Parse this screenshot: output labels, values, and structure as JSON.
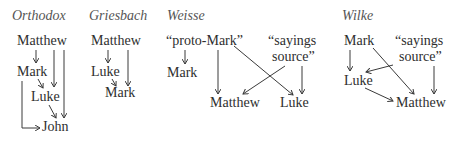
{
  "diagrams": [
    {
      "title": "Orthodox",
      "nodes": {
        "matthew": "Matthew",
        "mark": "Mark",
        "luke": "Luke",
        "john": "John"
      },
      "edges": [
        [
          "Matthew",
          "Mark"
        ],
        [
          "Matthew",
          "Luke"
        ],
        [
          "Matthew",
          "John"
        ],
        [
          "Mark",
          "Luke"
        ],
        [
          "Mark",
          "John"
        ],
        [
          "Luke",
          "John"
        ]
      ]
    },
    {
      "title": "Griesbach",
      "nodes": {
        "matthew": "Matthew",
        "luke": "Luke",
        "mark": "Mark"
      },
      "edges": [
        [
          "Matthew",
          "Luke"
        ],
        [
          "Matthew",
          "Mark"
        ],
        [
          "Luke",
          "Mark"
        ]
      ]
    },
    {
      "title": "Weisse",
      "nodes": {
        "protomark": "“proto-Mark”",
        "sayings1": "“sayings",
        "sayings2": "source”",
        "mark": "Mark",
        "matthew": "Matthew",
        "luke": "Luke"
      },
      "edges": [
        [
          "proto-Mark",
          "Mark"
        ],
        [
          "proto-Mark",
          "Matthew"
        ],
        [
          "proto-Mark",
          "Luke"
        ],
        [
          "sayings source",
          "Matthew"
        ],
        [
          "sayings source",
          "Luke"
        ]
      ]
    },
    {
      "title": "Wilke",
      "nodes": {
        "mark": "Mark",
        "sayings1": "“sayings",
        "sayings2": "source”",
        "luke": "Luke",
        "matthew": "Matthew"
      },
      "edges": [
        [
          "Mark",
          "Luke"
        ],
        [
          "Mark",
          "Matthew"
        ],
        [
          "sayings source",
          "Luke"
        ],
        [
          "sayings source",
          "Matthew"
        ],
        [
          "Luke",
          "Matthew"
        ]
      ]
    }
  ]
}
